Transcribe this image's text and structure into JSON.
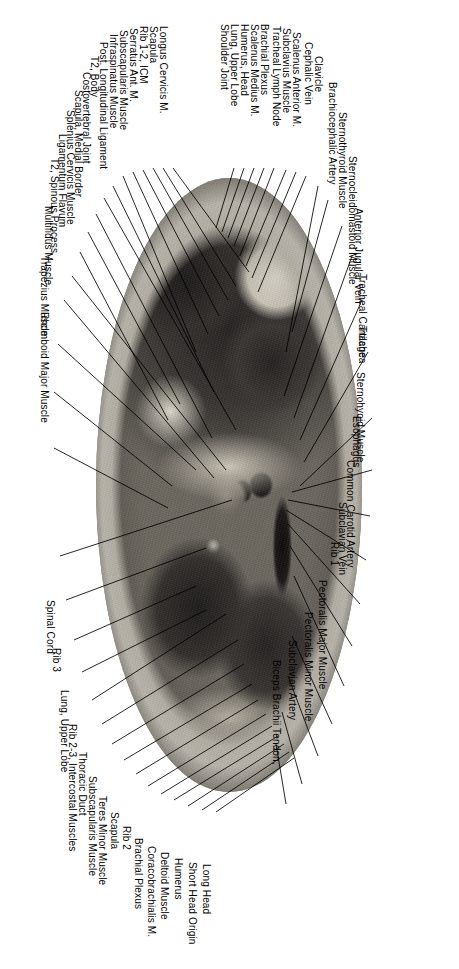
{
  "figure": {
    "type": "anatomical-cross-section",
    "orientation": "rotated-90-clockwise",
    "region": "Axial section, upper thorax at T2 level",
    "modality": "cryosection / anatomical plastinate photograph",
    "colorspace": "grayscale"
  },
  "labels_left": [
    {
      "id": "longus-cervicis-m",
      "text": "Longus Cervicis M."
    },
    {
      "id": "scapula-1",
      "text": "Scapula"
    },
    {
      "id": "rib-1-2-icm",
      "text": "Rib 1-2, ICM"
    },
    {
      "id": "serratus-ant-m",
      "text": "Serratus Ant. M."
    },
    {
      "id": "subscapularis-muscle-1",
      "text": "Subscapularis Muscle"
    },
    {
      "id": "infraspinatus-muscle",
      "text": "Infraspinatus Muscle"
    },
    {
      "id": "post-longitudinal-ligament",
      "text": "Post. Longitudinal Ligament"
    },
    {
      "id": "t2-body",
      "text": "T2, Body"
    },
    {
      "id": "costovertebral-joint",
      "text": "Costovertebral Joint"
    },
    {
      "id": "scapula-medial-border",
      "text": "Scapula, Medial Border"
    },
    {
      "id": "splenius-cervicis-muscle",
      "text": "Splenius Cervicis Muscle"
    },
    {
      "id": "ligamentum-flavum",
      "text": "Ligamentum Flavum"
    },
    {
      "id": "t2-spinous-process",
      "text": "T2, Spinous Process"
    },
    {
      "id": "multifidus-muscle",
      "text": "Multifidus  Muscle"
    },
    {
      "id": "trapezius-muscle",
      "text": "Trapezius Muscle"
    },
    {
      "id": "rhomboid-major-muscle",
      "text": "Rhomboid Major Muscle"
    },
    {
      "id": "spinal-cord",
      "text": "Spinal Cord"
    },
    {
      "id": "rib-3",
      "text": "Rib 3"
    },
    {
      "id": "lung-upper-lobe-left",
      "text": "Lung, Upper Lobe"
    },
    {
      "id": "rib-2-3-intercostal-muscles",
      "text": "Rib 2-3, Intercostal Muscles"
    },
    {
      "id": "thoracic-duct",
      "text": "Thoracic Duct"
    },
    {
      "id": "subscapularis-muscle-2",
      "text": "Subscapularis Muscle"
    },
    {
      "id": "teres-minor-muscle",
      "text": "Teres Minor Muscle"
    },
    {
      "id": "scapula-2",
      "text": "Scapula"
    },
    {
      "id": "rib-2",
      "text": "Rib 2"
    },
    {
      "id": "brachial-plexus-lower",
      "text": "Brachial Plexus"
    },
    {
      "id": "coracobrachialis-m",
      "text": "Coracobrachialis M."
    },
    {
      "id": "deltoid-muscle",
      "text": "Deltoid Muscle"
    },
    {
      "id": "humerus-lower",
      "text": "Humerus"
    },
    {
      "id": "short-head-origin",
      "text": "Short Head Origin"
    },
    {
      "id": "long-head",
      "text": "Long Head"
    }
  ],
  "labels_right": [
    {
      "id": "tracheal-lymph-node",
      "text": "Tracheal Lymph Node"
    },
    {
      "id": "subclavius-muscle",
      "text": "Subclavius Muscle"
    },
    {
      "id": "scalenus-anterior-m",
      "text": "Scalenus Anterior M."
    },
    {
      "id": "brachial-plexus-upper",
      "text": "Brachial Plexus"
    },
    {
      "id": "scalenus-medius-m",
      "text": "Scalenus Medius M."
    },
    {
      "id": "humerus-head",
      "text": "Humerus, Head"
    },
    {
      "id": "lung-upper-lobe-right",
      "text": "Lung, Upper Lobe"
    },
    {
      "id": "shoulder-joint",
      "text": "Shoulder Joint"
    },
    {
      "id": "cephalic-vein",
      "text": "Cephalic Vein"
    },
    {
      "id": "clavicle",
      "text": "Clavicle"
    },
    {
      "id": "brachiocephalic-artery",
      "text": "Brachiocephalic Artery"
    },
    {
      "id": "sternothyroid-muscle-upper",
      "text": "Sternothyroid Muscle"
    },
    {
      "id": "sternocleidomastoid-muscle",
      "text": "Sternocleidomastoid Muscle"
    },
    {
      "id": "anterior-jugular-vein",
      "text": "Anterior Jugular Vein"
    },
    {
      "id": "tracheal-cartilage",
      "text": "Tracheal Cartilage"
    },
    {
      "id": "trachea",
      "text": "Trachea"
    },
    {
      "id": "sternohyoid-muscle",
      "text": "Sternohyoid Muscle"
    },
    {
      "id": "esophagus",
      "text": "Esophagus"
    },
    {
      "id": "common-carotid-artery",
      "text": "Common Carotid Artery"
    },
    {
      "id": "subclavian-vein",
      "text": "Subclavian Vein"
    },
    {
      "id": "rib-1",
      "text": "Rib 1"
    },
    {
      "id": "pectoralis-major-muscle",
      "text": "Pectoralis Major Muscle"
    },
    {
      "id": "pectoralis-minor-muscle",
      "text": "Pectoralis Minor Muscle"
    },
    {
      "id": "subclavian-artery",
      "text": "Subclavian Artery"
    },
    {
      "id": "biceps-brachii-tendon",
      "text": "Biceps Brachii Tendon,"
    }
  ]
}
